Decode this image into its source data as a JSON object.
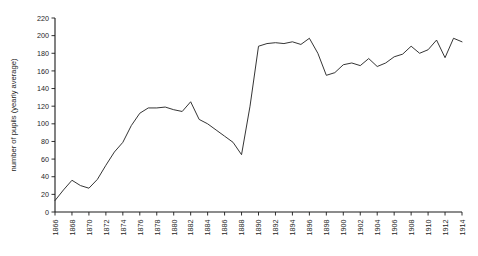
{
  "chart_data": {
    "type": "line",
    "title": "",
    "xlabel": "",
    "ylabel": "number of pupils (yearly average)",
    "xlim": [
      1866,
      1914
    ],
    "ylim": [
      0,
      220
    ],
    "grid": false,
    "legend": "none",
    "y_ticks": [
      0,
      20,
      40,
      60,
      80,
      100,
      120,
      140,
      160,
      180,
      200,
      220
    ],
    "x_ticks": [
      1866,
      1868,
      1870,
      1872,
      1874,
      1876,
      1878,
      1880,
      1882,
      1884,
      1886,
      1888,
      1890,
      1892,
      1894,
      1896,
      1898,
      1900,
      1902,
      1904,
      1906,
      1908,
      1910,
      1912,
      1914
    ],
    "series": [
      {
        "name": "number of pupils",
        "color": "#2a2a2a",
        "x": [
          1866,
          1867,
          1868,
          1869,
          1870,
          1871,
          1872,
          1873,
          1874,
          1875,
          1876,
          1877,
          1878,
          1879,
          1880,
          1881,
          1882,
          1883,
          1884,
          1885,
          1886,
          1887,
          1888,
          1889,
          1890,
          1891,
          1892,
          1893,
          1894,
          1895,
          1896,
          1897,
          1898,
          1899,
          1900,
          1901,
          1902,
          1903,
          1904,
          1905,
          1906,
          1907,
          1908,
          1909,
          1910,
          1911,
          1912,
          1913,
          1914
        ],
        "values": [
          13,
          25,
          36,
          30,
          27,
          37,
          53,
          68,
          79,
          98,
          112,
          118,
          118,
          119,
          116,
          114,
          125,
          105,
          100,
          93,
          86,
          79,
          65,
          120,
          188,
          191,
          192,
          191,
          193,
          190,
          197,
          180,
          155,
          158,
          167,
          169,
          166,
          174,
          165,
          169,
          176,
          179,
          188,
          180,
          184,
          195,
          175,
          197,
          193
        ]
      }
    ]
  }
}
